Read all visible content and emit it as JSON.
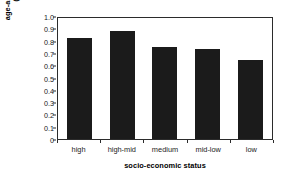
{
  "chart_data": {
    "type": "bar",
    "title": "",
    "subtitle": "",
    "categories": [
      "high",
      "high-mid",
      "medium",
      "mid-low",
      "low"
    ],
    "values": [
      0.825,
      0.88,
      0.745,
      0.735,
      0.645
    ],
    "xlabel": "socio-economic status",
    "ylabel_line1": "age-adjusted incidence",
    "ylabel_line2": "(per 100,000)",
    "ylabel": "age-adjusted incidence (per 100,000)",
    "ylim": [
      0,
      1.0
    ],
    "ytick_labels": [
      "1.0",
      "0.9",
      "0.8",
      "0.7",
      "0.6",
      "0.5",
      "0.4",
      "0.3",
      "0.2",
      "0.1",
      "0"
    ],
    "ytick_values": [
      1.0,
      0.9,
      0.8,
      0.7,
      0.6,
      0.5,
      0.4,
      0.3,
      0.2,
      0.1,
      0
    ],
    "grid": false,
    "legend": null,
    "legend_position": "none",
    "bar_color": "#1b1b1b",
    "axis_color": "#2b2b2b",
    "background_color": "#ffffff"
  }
}
